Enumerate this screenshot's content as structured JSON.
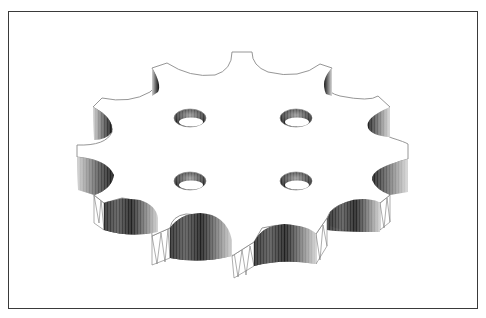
{
  "figure": {
    "teeth_count": 12,
    "hole_count": 4,
    "colors": {
      "frame": "#3a3a3a",
      "outline": "#8a8a8a",
      "shade_dark": "#1a1a1a",
      "shade_light": "#e8e8e8",
      "background": "#ffffff"
    },
    "holes": [
      {
        "cx": 190,
        "cy": 118
      },
      {
        "cx": 296,
        "cy": 118
      },
      {
        "cx": 190,
        "cy": 181
      },
      {
        "cx": 296,
        "cy": 181
      }
    ]
  }
}
